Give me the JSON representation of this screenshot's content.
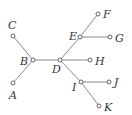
{
  "diagram": {
    "type": "tree",
    "nodes": [
      {
        "id": "A",
        "label": "A",
        "x": 13,
        "y": 83,
        "lx": 9,
        "ly": 99
      },
      {
        "id": "B",
        "label": "B",
        "x": 33,
        "y": 60,
        "lx": 20,
        "ly": 65
      },
      {
        "id": "C",
        "label": "C",
        "x": 13,
        "y": 36,
        "lx": 8,
        "ly": 29
      },
      {
        "id": "D",
        "label": "D",
        "x": 60,
        "y": 60,
        "lx": 52,
        "ly": 73
      },
      {
        "id": "E",
        "label": "E",
        "x": 80,
        "y": 37,
        "lx": 69,
        "ly": 40
      },
      {
        "id": "F",
        "label": "F",
        "x": 98,
        "y": 14,
        "lx": 103,
        "ly": 18
      },
      {
        "id": "G",
        "label": "G",
        "x": 110,
        "y": 37,
        "lx": 115,
        "ly": 42
      },
      {
        "id": "H",
        "label": "H",
        "x": 90,
        "y": 60,
        "lx": 95,
        "ly": 65
      },
      {
        "id": "I",
        "label": "I",
        "x": 81,
        "y": 82,
        "lx": 72,
        "ly": 91
      },
      {
        "id": "J",
        "label": "J",
        "x": 109,
        "y": 82,
        "lx": 114,
        "ly": 86
      },
      {
        "id": "K",
        "label": "K",
        "x": 99,
        "y": 106,
        "lx": 104,
        "ly": 111
      }
    ],
    "edges": [
      [
        "C",
        "B"
      ],
      [
        "A",
        "B"
      ],
      [
        "B",
        "D"
      ],
      [
        "D",
        "E"
      ],
      [
        "E",
        "F"
      ],
      [
        "E",
        "G"
      ],
      [
        "D",
        "H"
      ],
      [
        "D",
        "I"
      ],
      [
        "I",
        "J"
      ],
      [
        "I",
        "K"
      ]
    ]
  }
}
